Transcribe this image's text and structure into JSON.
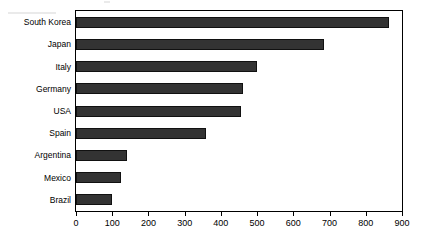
{
  "chart_data": {
    "type": "bar",
    "orientation": "horizontal",
    "title": "",
    "subtitle": "",
    "xlabel": "",
    "ylabel": "",
    "categories": [
      "South Korea",
      "Japan",
      "Italy",
      "Germany",
      "USA",
      "Spain",
      "Argentina",
      "Mexico",
      "Brazil"
    ],
    "values": [
      865,
      685,
      500,
      460,
      455,
      360,
      140,
      125,
      100
    ],
    "series": [
      {
        "name": "",
        "values": [
          865,
          685,
          500,
          460,
          455,
          360,
          140,
          125,
          100
        ]
      }
    ],
    "xlim": [
      0,
      900
    ],
    "xticks": [
      0,
      100,
      200,
      300,
      400,
      500,
      600,
      700,
      800,
      900
    ],
    "xtick_labels": [
      "0",
      "100",
      "200",
      "300",
      "400",
      "500",
      "600",
      "700",
      "800",
      "900"
    ],
    "grid": false,
    "legend": false,
    "legend_position": "none",
    "bar_color": "#333333",
    "bar_edge_color": "#111111",
    "frame_color": "#000000",
    "background_color": "#ffffff"
  }
}
